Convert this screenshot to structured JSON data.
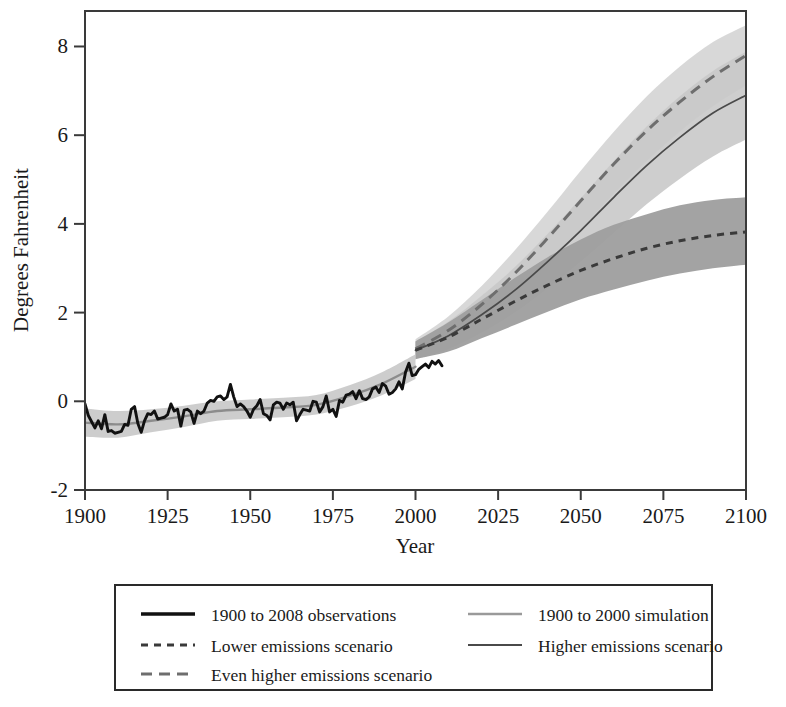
{
  "chart_data": {
    "type": "line",
    "title": "",
    "xlabel": "Year",
    "ylabel": "Degrees Fahrenheit",
    "xlim": [
      1900,
      2100
    ],
    "ylim": [
      -2,
      8.8
    ],
    "xticks": [
      "1900",
      "1925",
      "1950",
      "1975",
      "2000",
      "2025",
      "2050",
      "2075",
      "2100"
    ],
    "xtick_values": [
      1900,
      1925,
      1950,
      1975,
      2000,
      2025,
      2050,
      2075,
      2100
    ],
    "yticks": [
      "-2",
      "0",
      "2",
      "4",
      "6",
      "8"
    ],
    "ytick_values": [
      -2,
      0,
      2,
      4,
      6,
      8
    ],
    "grid": false,
    "legend_position": "below-plot",
    "series": [
      {
        "name": "1900 to 2008 observations",
        "style": "thick-solid-black",
        "color": "#111111",
        "x": [
          1900,
          1901,
          1902,
          1903,
          1904,
          1905,
          1906,
          1907,
          1908,
          1909,
          1910,
          1911,
          1912,
          1913,
          1914,
          1915,
          1916,
          1917,
          1918,
          1919,
          1920,
          1921,
          1922,
          1923,
          1924,
          1925,
          1926,
          1927,
          1928,
          1929,
          1930,
          1931,
          1932,
          1933,
          1934,
          1935,
          1936,
          1937,
          1938,
          1939,
          1940,
          1941,
          1942,
          1943,
          1944,
          1945,
          1946,
          1947,
          1948,
          1949,
          1950,
          1951,
          1952,
          1953,
          1954,
          1955,
          1956,
          1957,
          1958,
          1959,
          1960,
          1961,
          1962,
          1963,
          1964,
          1965,
          1966,
          1967,
          1968,
          1969,
          1970,
          1971,
          1972,
          1973,
          1974,
          1975,
          1976,
          1977,
          1978,
          1979,
          1980,
          1981,
          1982,
          1983,
          1984,
          1985,
          1986,
          1987,
          1988,
          1989,
          1990,
          1991,
          1992,
          1993,
          1994,
          1995,
          1996,
          1997,
          1998,
          1999,
          2000,
          2001,
          2002,
          2003,
          2004,
          2005,
          2006,
          2007,
          2008
        ],
        "values": [
          -0.06,
          -0.32,
          -0.46,
          -0.6,
          -0.44,
          -0.62,
          -0.3,
          -0.68,
          -0.66,
          -0.72,
          -0.7,
          -0.68,
          -0.52,
          -0.54,
          -0.18,
          -0.12,
          -0.5,
          -0.7,
          -0.44,
          -0.28,
          -0.3,
          -0.22,
          -0.4,
          -0.38,
          -0.36,
          -0.3,
          -0.06,
          -0.22,
          -0.18,
          -0.56,
          -0.2,
          -0.18,
          -0.24,
          -0.5,
          -0.22,
          -0.28,
          -0.22,
          -0.04,
          0.02,
          0.0,
          0.1,
          0.12,
          0.04,
          0.1,
          0.38,
          0.1,
          -0.12,
          -0.06,
          -0.12,
          -0.22,
          -0.36,
          -0.18,
          -0.1,
          0.04,
          -0.28,
          -0.32,
          -0.42,
          -0.08,
          -0.02,
          -0.04,
          -0.18,
          -0.04,
          -0.08,
          -0.02,
          -0.44,
          -0.3,
          -0.18,
          -0.2,
          -0.22,
          0.0,
          -0.02,
          -0.24,
          -0.12,
          0.12,
          -0.24,
          -0.18,
          -0.34,
          0.02,
          -0.02,
          0.14,
          0.16,
          0.22,
          0.06,
          0.24,
          0.06,
          0.04,
          0.1,
          0.28,
          0.32,
          0.2,
          0.4,
          0.34,
          0.16,
          0.2,
          0.28,
          0.44,
          0.28,
          0.66,
          0.86,
          0.58,
          0.6,
          0.72,
          0.78,
          0.84,
          0.76,
          0.9,
          0.84,
          0.92,
          0.8
        ]
      },
      {
        "name": "1900 to 2000 simulation",
        "style": "gray-solid",
        "color": "#8c8c8c",
        "x": [
          1900,
          1910,
          1920,
          1930,
          1940,
          1950,
          1960,
          1970,
          1980,
          1990,
          2000
        ],
        "values": [
          -0.48,
          -0.52,
          -0.44,
          -0.34,
          -0.22,
          -0.18,
          -0.14,
          -0.08,
          0.12,
          0.4,
          0.78
        ],
        "band_lower": [
          -0.8,
          -0.82,
          -0.7,
          -0.58,
          -0.44,
          -0.4,
          -0.36,
          -0.3,
          -0.12,
          0.14,
          0.5
        ],
        "band_upper": [
          -0.16,
          -0.22,
          -0.18,
          -0.1,
          0.0,
          0.04,
          0.08,
          0.14,
          0.36,
          0.66,
          1.06
        ]
      },
      {
        "name": "Lower emissions scenario",
        "style": "fine-dashed-dark",
        "color": "#3a3a3a",
        "band_color": "#9e9e9e",
        "x": [
          2000,
          2010,
          2020,
          2030,
          2040,
          2050,
          2060,
          2070,
          2080,
          2090,
          2100
        ],
        "values": [
          1.15,
          1.45,
          1.85,
          2.25,
          2.62,
          2.95,
          3.22,
          3.45,
          3.62,
          3.74,
          3.82
        ],
        "band_lower": [
          0.95,
          1.12,
          1.42,
          1.72,
          2.02,
          2.3,
          2.52,
          2.72,
          2.88,
          3.0,
          3.08
        ],
        "band_upper": [
          1.35,
          1.78,
          2.28,
          2.78,
          3.25,
          3.65,
          3.98,
          4.22,
          4.42,
          4.54,
          4.6
        ]
      },
      {
        "name": "Higher emissions scenario",
        "style": "thin-solid-dark",
        "color": "#4a4a4a",
        "band_color": "#c9c9c9",
        "x": [
          2000,
          2010,
          2020,
          2030,
          2040,
          2050,
          2060,
          2070,
          2080,
          2090,
          2100
        ],
        "values": [
          1.15,
          1.48,
          1.95,
          2.5,
          3.15,
          3.85,
          4.6,
          5.32,
          5.95,
          6.5,
          6.9
        ],
        "band_lower": [
          0.95,
          1.18,
          1.55,
          2.0,
          2.55,
          3.15,
          3.8,
          4.45,
          5.02,
          5.52,
          5.9
        ],
        "band_upper": [
          1.35,
          1.8,
          2.38,
          3.02,
          3.78,
          4.58,
          5.42,
          6.2,
          6.88,
          7.45,
          7.88
        ]
      },
      {
        "name": "Even higher emissions scenario",
        "style": "medium-dashed-gray",
        "color": "#6e6e6e",
        "band_color": "#d6d6d6",
        "x": [
          2000,
          2010,
          2020,
          2030,
          2040,
          2050,
          2060,
          2070,
          2080,
          2090,
          2100
        ],
        "values": [
          1.18,
          1.6,
          2.18,
          2.88,
          3.68,
          4.52,
          5.35,
          6.1,
          6.75,
          7.32,
          7.8
        ],
        "band_lower": [
          0.98,
          1.32,
          1.8,
          2.4,
          3.1,
          3.88,
          4.68,
          5.42,
          6.08,
          6.65,
          7.12
        ],
        "band_upper": [
          1.4,
          1.92,
          2.6,
          3.4,
          4.28,
          5.2,
          6.08,
          6.88,
          7.55,
          8.1,
          8.48
        ]
      }
    ]
  },
  "axes": {
    "y_title": "Degrees Fahrenheit",
    "x_title": "Year",
    "x_tick_labels": [
      "1900",
      "1925",
      "1950",
      "1975",
      "2000",
      "2025",
      "2050",
      "2075",
      "2100"
    ],
    "y_tick_labels": [
      "8",
      "6",
      "4",
      "2",
      "0",
      "-2"
    ]
  },
  "legend": {
    "entries": [
      {
        "label": "1900 to 2008 observations",
        "style": "thick-solid-black",
        "column": "left"
      },
      {
        "label": "Lower emissions scenario",
        "style": "fine-dashed-dark",
        "column": "left"
      },
      {
        "label": "Even higher emissions scenario",
        "style": "medium-dashed-gray",
        "column": "left"
      },
      {
        "label": "1900 to 2000 simulation",
        "style": "gray-solid",
        "column": "right"
      },
      {
        "label": "Higher emissions scenario",
        "style": "thin-solid-dark",
        "column": "right"
      }
    ]
  },
  "colors": {
    "observations": "#111111",
    "simulation": "#8c8c8c",
    "lower_band": "#9e9e9e",
    "higher_band": "#c9c9c9",
    "even_higher_band": "#d6d6d6",
    "frame": "#3a3a3a",
    "background": "#ffffff"
  }
}
